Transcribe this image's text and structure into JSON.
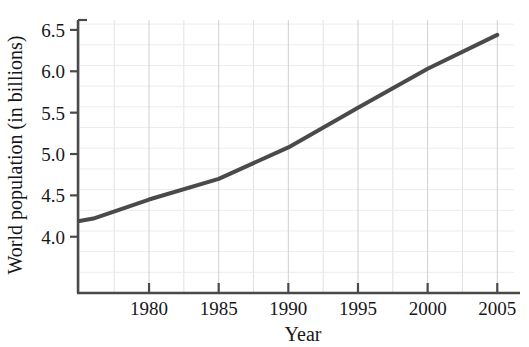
{
  "chart_data": {
    "type": "line",
    "title": "",
    "subtitle": "",
    "xlabel": "Year",
    "ylabel": "World population (in billions)",
    "xlim": [
      1974.9,
      2006.2
    ],
    "ylim": [
      3.32,
      6.62
    ],
    "xticks": [
      1980,
      1985,
      1990,
      1995,
      2000,
      2005
    ],
    "xtick_labels": [
      "1980",
      "1985",
      "1990",
      "1995",
      "2000",
      "2005"
    ],
    "yticks": [
      4.0,
      4.5,
      5.0,
      5.5,
      6.0,
      6.5
    ],
    "ytick_labels": [
      "4.0",
      "4.5",
      "5.0",
      "5.5",
      "6.0",
      "6.5"
    ],
    "x_minor_step": 2.5,
    "y_minor_step": 0.25,
    "grid": true,
    "grid_color": "#d8d8d8",
    "legend": null,
    "legend_position": "none",
    "line_color": "#4a4a4a",
    "line_width": 4,
    "axis_color": "#4a4a4a",
    "series": [
      {
        "name": "World population",
        "x": [
          1975,
          1976,
          1980,
          1985,
          1990,
          1995,
          2000,
          2005
        ],
        "values": [
          4.19,
          4.22,
          4.45,
          4.7,
          5.08,
          5.56,
          6.03,
          6.44
        ]
      }
    ],
    "annotations": []
  }
}
